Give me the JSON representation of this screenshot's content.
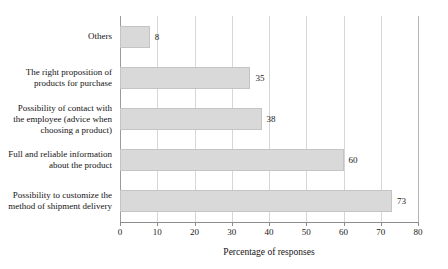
{
  "chart_data": {
    "type": "bar",
    "orientation": "horizontal",
    "title": "",
    "xlabel": "Percentage of responses",
    "ylabel": "",
    "xlim": [
      0,
      80
    ],
    "xticks": [
      0,
      10,
      20,
      30,
      40,
      50,
      60,
      70,
      80
    ],
    "xtick_labels": [
      "0",
      "10",
      "20",
      "30",
      "40",
      "50",
      "60",
      "70",
      "80"
    ],
    "grid": true,
    "legend": false,
    "categories": [
      "Others",
      "The right proposition of products for purchase",
      "Possibility of contact with the employee (advice when choosing a product)",
      "Full and reliable information about the product",
      "Possibility to customize the method of shipment delivery"
    ],
    "category_lines": [
      [
        "Others"
      ],
      [
        "The right proposition of",
        "products for purchase"
      ],
      [
        "Possibility of contact with",
        "the employee (advice when",
        "choosing a product)"
      ],
      [
        "Full and reliable information",
        "about the product"
      ],
      [
        "Possibility to customize the",
        "method of shipment delivery"
      ]
    ],
    "values": [
      8,
      35,
      38,
      60,
      73
    ],
    "value_labels": [
      "8",
      "35",
      "38",
      "60",
      "73"
    ],
    "colors": {
      "bar_fill": "#d9d9d9",
      "bar_border": "#c4c4c4",
      "gridline": "#d6d6d6",
      "axis": "#8c8c8c",
      "text": "#1a1a1a",
      "background": "#ffffff"
    }
  }
}
